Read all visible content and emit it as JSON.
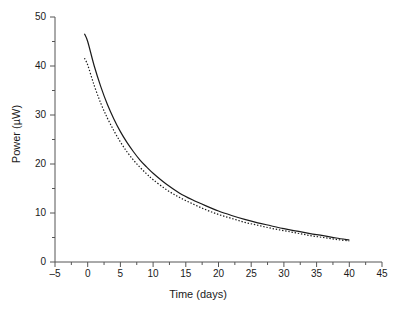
{
  "chart_data": {
    "type": "line",
    "title": "",
    "xlabel": "Time (days)",
    "ylabel": "Power (µW)",
    "xlim": [
      -5,
      45
    ],
    "ylim": [
      0,
      50
    ],
    "xticks": [
      -5,
      0,
      5,
      10,
      15,
      20,
      25,
      30,
      35,
      40,
      45
    ],
    "xticklabels": [
      "-5",
      "0",
      "5",
      "10",
      "15",
      "20",
      "25",
      "30",
      "35",
      "40",
      "45"
    ],
    "yticks": [
      0,
      10,
      20,
      30,
      40,
      50
    ],
    "yticklabels": [
      "0",
      "10",
      "20",
      "30",
      "40",
      "50"
    ],
    "x_minor_interval": 2.5,
    "y_minor_interval": 5,
    "grid": false,
    "legend": "none",
    "spines": [
      "left",
      "bottom"
    ],
    "series": [
      {
        "name": "solid-curve",
        "style": "solid",
        "color": "#1a1a1a",
        "x": [
          -0.5,
          0,
          1,
          2,
          3,
          4,
          5,
          6,
          7,
          8,
          9,
          10,
          12,
          14,
          16,
          18,
          20,
          22,
          24,
          26,
          28,
          30,
          32,
          34,
          36,
          38,
          40
        ],
        "y": [
          46.6,
          45.0,
          40.0,
          35.8,
          32.2,
          29.2,
          26.6,
          24.4,
          22.5,
          20.8,
          19.4,
          18.1,
          15.9,
          14.1,
          12.7,
          11.5,
          10.4,
          9.5,
          8.7,
          8.0,
          7.4,
          6.8,
          6.3,
          5.8,
          5.4,
          4.9,
          4.5
        ]
      },
      {
        "name": "dotted-curve",
        "style": "dotted",
        "color": "#1a1a1a",
        "x": [
          -0.5,
          0,
          1,
          2,
          3,
          4,
          5,
          6,
          7,
          8,
          9,
          10,
          12,
          14,
          16,
          18,
          20,
          22,
          24,
          26,
          28,
          30,
          32,
          34,
          36,
          38,
          40
        ],
        "y": [
          41.6,
          40.2,
          36.0,
          32.4,
          29.4,
          26.8,
          24.5,
          22.5,
          20.8,
          19.3,
          18.0,
          16.8,
          14.8,
          13.2,
          11.9,
          10.7,
          9.7,
          8.9,
          8.1,
          7.5,
          6.9,
          6.4,
          5.9,
          5.4,
          5.0,
          4.6,
          4.3
        ]
      }
    ]
  }
}
